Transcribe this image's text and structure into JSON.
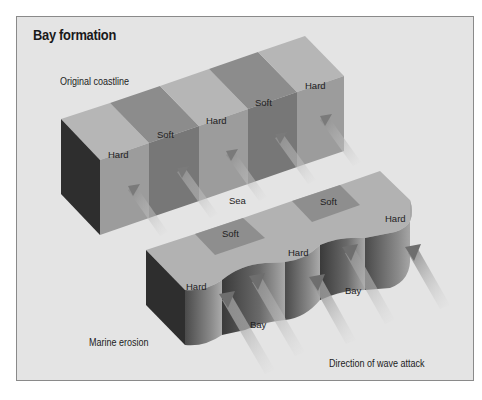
{
  "title": "Bay formation",
  "captions": {
    "original_coastline": "Original coastline",
    "marine_erosion": "Marine erosion",
    "direction_of_wave_attack": "Direction of wave attack",
    "sea": "Sea"
  },
  "original_coastline_bands": [
    {
      "label": "Hard",
      "rock": "hard"
    },
    {
      "label": "Soft",
      "rock": "soft"
    },
    {
      "label": "Hard",
      "rock": "hard"
    },
    {
      "label": "Soft",
      "rock": "soft"
    },
    {
      "label": "Hard",
      "rock": "hard"
    }
  ],
  "eroded_coastline_labels": {
    "headland_1": "Hard",
    "soft_1": "Soft",
    "headland_2": "Hard",
    "soft_2": "Soft",
    "headland_3": "Hard",
    "bay_1": "Bay",
    "bay_2": "Bay"
  },
  "colors": {
    "background": "#e4e4e4",
    "frame_border": "#8a8a8a",
    "hard_top": "#b4b4b4",
    "soft_top": "#8c8c8c",
    "hard_front": "#9a9a9a",
    "soft_front": "#767676",
    "side_dark": "#2e2e2e"
  }
}
